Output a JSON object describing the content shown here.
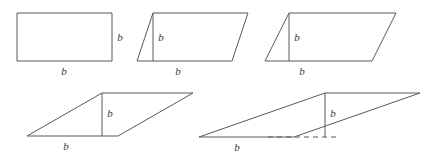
{
  "figure": {
    "canvas": {
      "width": 435,
      "height": 158,
      "background": "#ffffff"
    },
    "style": {
      "stroke_color": "#58595b",
      "label_color": "#3b3b3d",
      "stroke_width": 1,
      "dash_pattern": "5 4"
    },
    "shapes": [
      {
        "id": "shape-1",
        "name": "rectangle",
        "kind": "rectangle",
        "shear_offset": 0,
        "outline_points": "17,13 112,13 112,61 17,61",
        "height_line": null,
        "base_extension": null,
        "labels": {
          "base": {
            "text": "b",
            "x": 64,
            "y": 72
          },
          "height": {
            "text": "b",
            "x": 120,
            "y": 38
          }
        }
      },
      {
        "id": "shape-2",
        "name": "parallelogram-slight-shear",
        "kind": "parallelogram",
        "shear_offset": 16,
        "outline_points": "137,61 153,13 248,13 232,61",
        "height_line": {
          "x1": 153,
          "y1": 13,
          "x2": 153,
          "y2": 61
        },
        "base_extension": null,
        "labels": {
          "base": {
            "text": "b",
            "x": 178,
            "y": 72
          },
          "height": {
            "text": "b",
            "x": 161,
            "y": 38
          }
        }
      },
      {
        "id": "shape-3",
        "name": "parallelogram-medium-shear",
        "kind": "parallelogram",
        "shear_offset": 24,
        "outline_points": "265,61 289,13 396,13 372,61",
        "height_line": {
          "x1": 289,
          "y1": 13,
          "x2": 289,
          "y2": 61
        },
        "base_extension": null,
        "labels": {
          "base": {
            "text": "b",
            "x": 302,
            "y": 72
          },
          "height": {
            "text": "b",
            "x": 297,
            "y": 38
          }
        }
      },
      {
        "id": "shape-4",
        "name": "parallelogram-strong-shear",
        "kind": "parallelogram",
        "shear_offset": 75,
        "outline_points": "27,136 102,93 193,93 118,136",
        "height_line": {
          "x1": 102,
          "y1": 93,
          "x2": 102,
          "y2": 136
        },
        "base_extension": null,
        "labels": {
          "base": {
            "text": "b",
            "x": 66,
            "y": 147
          },
          "height": {
            "text": "b",
            "x": 110,
            "y": 114
          }
        }
      },
      {
        "id": "shape-5",
        "name": "parallelogram-extreme-shear",
        "kind": "parallelogram",
        "shear_offset": 126,
        "outline_points": "199,137 325,93 420,93 294,137",
        "height_line": {
          "x1": 325,
          "y1": 93,
          "x2": 325,
          "y2": 137
        },
        "base_extension": {
          "x1": 268,
          "y1": 137,
          "x2": 340,
          "y2": 137
        },
        "labels": {
          "base": {
            "text": "b",
            "x": 237,
            "y": 148
          },
          "height": {
            "text": "b",
            "x": 333,
            "y": 114
          }
        }
      }
    ]
  }
}
